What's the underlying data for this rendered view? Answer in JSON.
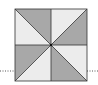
{
  "diagram": {
    "type": "pinwheel-square",
    "square": {
      "x": 15,
      "y": 9,
      "size": 72
    },
    "colors": {
      "dark": "#a8a8a8",
      "light": "#ececec",
      "stroke": "#333333",
      "dotted": "#555555"
    },
    "guide_line_y": 71
  }
}
